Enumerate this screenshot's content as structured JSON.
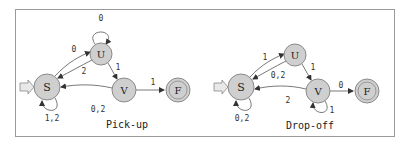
{
  "diagrams": [
    {
      "caption": "Pick-up",
      "nodes": [
        {
          "id": "S",
          "label": "S",
          "x": 47,
          "y": 87,
          "r": 13,
          "accepting": false,
          "start": true
        },
        {
          "id": "U",
          "label": "U",
          "x": 101,
          "y": 54,
          "r": 11,
          "accepting": false
        },
        {
          "id": "V",
          "label": "V",
          "x": 124,
          "y": 90,
          "r": 12,
          "accepting": false
        },
        {
          "id": "F",
          "label": "F",
          "x": 178,
          "y": 90,
          "r": 12,
          "accepting": true
        }
      ],
      "edges": [
        {
          "from": "U",
          "to": "U",
          "label": "0"
        },
        {
          "from": "S",
          "to": "U",
          "label": "0"
        },
        {
          "from": "U",
          "to": "S",
          "label": "2"
        },
        {
          "from": "U",
          "to": "V",
          "label": "1"
        },
        {
          "from": "V",
          "to": "F",
          "label": "1"
        },
        {
          "from": "V",
          "to": "S",
          "label": "0,2"
        },
        {
          "from": "S",
          "to": "S",
          "label": "1,2"
        }
      ]
    },
    {
      "caption": "Drop-off",
      "nodes": [
        {
          "id": "S",
          "label": "S",
          "x": 241,
          "y": 87,
          "r": 13,
          "accepting": false,
          "start": true
        },
        {
          "id": "U",
          "label": "U",
          "x": 295,
          "y": 55,
          "r": 11,
          "accepting": false
        },
        {
          "id": "V",
          "label": "V",
          "x": 318,
          "y": 91,
          "r": 12,
          "accepting": false
        },
        {
          "id": "F",
          "label": "F",
          "x": 367,
          "y": 91,
          "r": 12,
          "accepting": true
        }
      ],
      "edges": [
        {
          "from": "S",
          "to": "U",
          "label": "1"
        },
        {
          "from": "U",
          "to": "S",
          "label": "0,2"
        },
        {
          "from": "U",
          "to": "V",
          "label": "1"
        },
        {
          "from": "V",
          "to": "F",
          "label": "0"
        },
        {
          "from": "V",
          "to": "S",
          "label": "2"
        },
        {
          "from": "S",
          "to": "S",
          "label": "0,2"
        },
        {
          "from": "V",
          "to": "V",
          "label": "1"
        }
      ]
    }
  ],
  "labels": {
    "left": {
      "u_loop": "0",
      "s_to_u": "0",
      "u_to_s": "2",
      "u_to_v": "1",
      "v_to_f": "1",
      "v_to_s": "0,2",
      "s_loop": "1,2",
      "node_s": "S",
      "node_u": "U",
      "node_v": "V",
      "node_f": "F",
      "caption": "Pick-up"
    },
    "right": {
      "s_to_u": "1",
      "u_to_s": "0,2",
      "u_to_v": "1",
      "v_to_f": "0",
      "v_to_s": "2",
      "s_loop": "0,2",
      "v_loop": "1",
      "node_s": "S",
      "node_u": "U",
      "node_v": "V",
      "node_f": "F",
      "caption": "Drop-off"
    }
  },
  "colors": {
    "node_fill": "#cfcfcf",
    "node_stroke": "#8a8a8a",
    "edge": "#555555",
    "start_arrow_fill": "#e8e8e8",
    "frame": "#9a9a9a"
  }
}
